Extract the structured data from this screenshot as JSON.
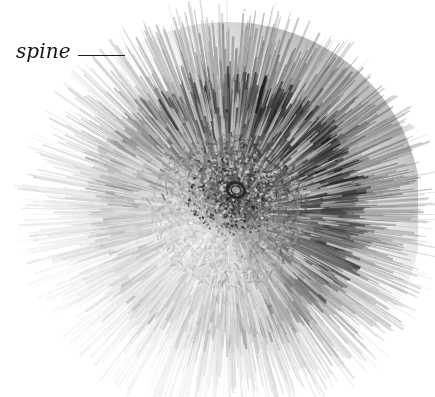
{
  "figure": {
    "kind": "scientific-photograph",
    "view": "aboral (top) view of whole animal",
    "background_color": "#ffffff",
    "width": 435,
    "height": 397
  },
  "annotations": [
    {
      "id": "spine",
      "label": "spine",
      "label_style": "italic",
      "text_color": "#141414",
      "leader_color": "#1c1c1c",
      "label_x": 16,
      "label_y": 38,
      "leader_x1": 78,
      "leader_y1": 55,
      "leader_x2": 125,
      "leader_y2": 55,
      "points_to": "outer spine tips at upper-left of the test"
    }
  ],
  "specimen": {
    "center_x": 228,
    "center_y": 212,
    "body_radius": 112,
    "spine_reach": 190,
    "core_color": "#3a3a3a",
    "spine_dark_color": "#1a1a1a",
    "spine_mid_color": "#6e6e6e",
    "spine_light_color": "#c8c8c8",
    "shading_note": "upper-right quadrant darkest, lower-left quadrant lightest",
    "features": [
      {
        "name": "periproct-ring",
        "x": 236,
        "y": 190,
        "radius": 9,
        "color": "#202020"
      },
      {
        "name": "aboral-disc",
        "x": 232,
        "y": 196,
        "radius": 46,
        "color": "#4a4a4a"
      }
    ]
  },
  "artifacts": [
    {
      "name": "scan-speck-top",
      "x": 188,
      "y": 1,
      "width": 2,
      "height": 5
    },
    {
      "name": "scan-speck-top-right",
      "x": 243,
      "y": 9,
      "width": 3,
      "height": 2
    }
  ]
}
